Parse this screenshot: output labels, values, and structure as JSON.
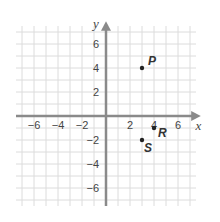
{
  "chart_data": {
    "type": "scatter",
    "title": "",
    "xlabel": "x",
    "ylabel": "y",
    "xlim": [
      -7,
      7
    ],
    "ylim": [
      -7,
      7
    ],
    "grid": true,
    "x_ticks": [
      -6,
      -4,
      -2,
      2,
      4,
      6
    ],
    "y_ticks": [
      6,
      4,
      2,
      -2,
      -4,
      -6
    ],
    "points": [
      {
        "label": "P",
        "x": 3,
        "y": 4
      },
      {
        "label": "R",
        "x": 4,
        "y": -1
      },
      {
        "label": "S",
        "x": 3,
        "y": -2
      }
    ]
  },
  "colors": {
    "grid": "#dcdcdc",
    "axis": "#8a8a8a",
    "point": "#222222"
  }
}
